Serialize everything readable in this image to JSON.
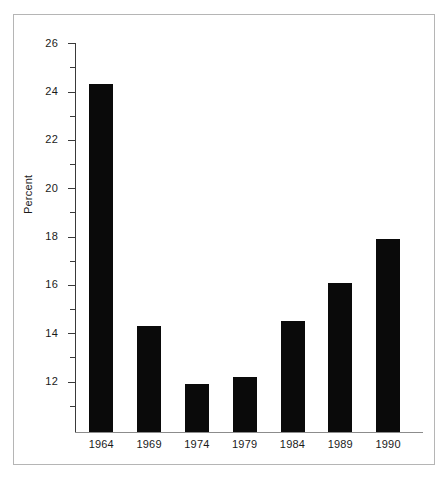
{
  "chart_data": {
    "type": "bar",
    "title": "",
    "xlabel": "",
    "ylabel": "Percent",
    "categories": [
      "1964",
      "1969",
      "1974",
      "1979",
      "1984",
      "1989",
      "1990"
    ],
    "values": [
      24.3,
      14.3,
      11.9,
      12.2,
      14.5,
      16.1,
      17.9
    ],
    "ylim": [
      10.4,
      26
    ],
    "yticks": [
      26,
      24,
      22,
      20,
      18,
      16,
      14,
      12
    ],
    "ytick_labels": [
      "26",
      "24",
      "22",
      "20",
      "18",
      "16",
      "14",
      "12"
    ],
    "minor_ticks": [
      25,
      23,
      21,
      19,
      17,
      15,
      13,
      11
    ],
    "grid": false,
    "legend": false,
    "bar_color": "#0a0a0a",
    "axis_color": "#3a3a3a",
    "frame_color": "#b5b5b5",
    "background": "#ffffff"
  },
  "figure": {
    "y_axis_title": "Percent"
  }
}
